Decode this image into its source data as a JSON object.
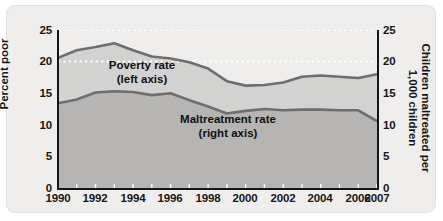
{
  "chart_data": {
    "type": "area",
    "title": "",
    "subtitle": "",
    "xlabel": "",
    "ylabel": "Percent poor",
    "y2label": "Children maltreated per 1,000 children",
    "x": [
      1990,
      1991,
      1992,
      1993,
      1994,
      1995,
      1996,
      1997,
      1998,
      1999,
      2000,
      2001,
      2002,
      2003,
      2004,
      2005,
      2006,
      2007
    ],
    "xlim": [
      1990,
      2007
    ],
    "ylim": [
      0,
      25
    ],
    "y2lim": [
      0,
      25
    ],
    "yticks": [
      0,
      5,
      10,
      15,
      20,
      25
    ],
    "y2ticks": [
      0,
      5,
      10,
      15,
      20,
      25
    ],
    "xticks": [
      1990,
      1992,
      1994,
      1996,
      1998,
      2000,
      2002,
      2004,
      2006,
      2007
    ],
    "xtick_labels": [
      "1990",
      "1992",
      "1994",
      "1996",
      "1998",
      "2000",
      "2002",
      "2004",
      "2006",
      "2007"
    ],
    "ytick_labels": [
      "0",
      "5",
      "10",
      "15",
      "20",
      "25"
    ],
    "y2tick_labels": [
      "0",
      "5",
      "10",
      "15",
      "20",
      "25"
    ],
    "grid": "horizontal dotted white gridlines at 20 and 25",
    "legend_position": "inline annotations",
    "series": [
      {
        "name": "Poverty rate",
        "axis": "left",
        "annotation": "Poverty rate",
        "annotation_sub": "(left axis)",
        "line_color": "#6e6e6e",
        "fill_color": "#d2d2d0",
        "values": [
          20.6,
          21.8,
          22.3,
          22.9,
          21.8,
          20.8,
          20.5,
          19.9,
          18.9,
          16.9,
          16.2,
          16.3,
          16.7,
          17.6,
          17.8,
          17.6,
          17.4,
          18.0
        ]
      },
      {
        "name": "Maltreatment rate",
        "axis": "right",
        "annotation": "Maltreatment rate",
        "annotation_sub": "(right axis)",
        "line_color": "#6e6e6e",
        "fill_color": "#b6b5b3",
        "values": [
          13.4,
          14.0,
          15.1,
          15.3,
          15.2,
          14.7,
          15.0,
          13.9,
          12.9,
          11.8,
          12.2,
          12.5,
          12.3,
          12.4,
          12.4,
          12.3,
          12.3,
          10.6
        ]
      }
    ]
  },
  "axes": {
    "left_title": "Percent poor",
    "right_title": "Children maltreated per 1,000 children",
    "right_title_line1": "Children maltreated per",
    "right_title_line2": "1,000 children"
  },
  "annotations": {
    "poverty_line1": "Poverty rate",
    "poverty_line2": "(left axis)",
    "maltreatment_line1": "Maltreatment rate",
    "maltreatment_line2": "(right axis)"
  },
  "colors": {
    "panel_background": "#efeeec",
    "poverty_band": "#d2d2d0",
    "maltreatment_band": "#b6b5b3",
    "line": "#6e6e6e",
    "axis": "#161616",
    "gridline": "#ffffff"
  }
}
